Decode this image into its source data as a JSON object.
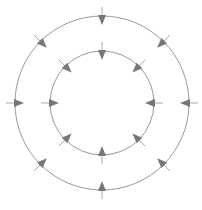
{
  "diagram": {
    "type": "concentric-circles-inward-arrows",
    "width": 202,
    "height": 210,
    "center": {
      "x": 102,
      "y": 103
    },
    "colors": {
      "background": "#ffffff",
      "circle_stroke": "#9a9a9a",
      "tick_stroke": "#a8a8a8",
      "arrowhead_fill": "#777777"
    },
    "circles": [
      {
        "name": "outer-circle",
        "radius": 87,
        "arrow_count": 8,
        "arrow_direction": "inward"
      },
      {
        "name": "inner-circle",
        "radius": 52,
        "arrow_count": 8,
        "arrow_direction": "inward"
      }
    ],
    "arrow_angles_deg": [
      0,
      45,
      90,
      135,
      180,
      225,
      270,
      315
    ],
    "arrow": {
      "tick_outside": 9,
      "tick_inside": 2,
      "head_length": 9,
      "head_half_width": 4
    }
  }
}
